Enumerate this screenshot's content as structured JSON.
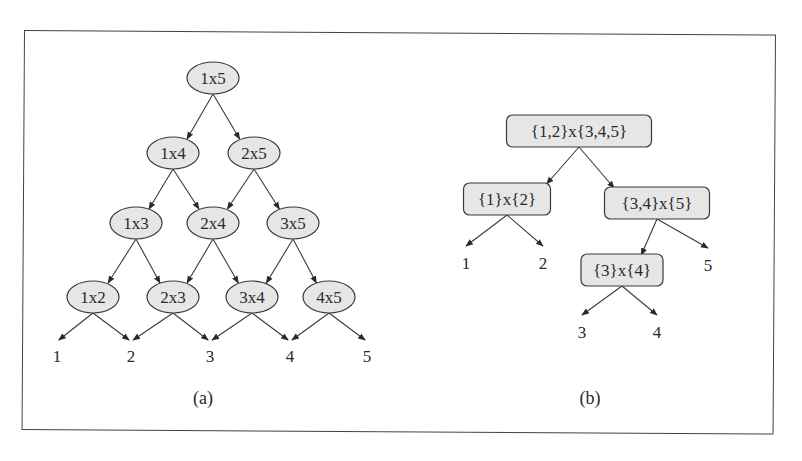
{
  "colors": {
    "node_fill": "#e6e6e6",
    "node_stroke": "#3a3a3a",
    "text": "#2a2a2a",
    "frame": "#444444"
  },
  "panel_a": {
    "caption": "(a)",
    "nodes": [
      {
        "id": "1x5",
        "label": "1x5",
        "x": 213,
        "y": 78
      },
      {
        "id": "1x4",
        "label": "1x4",
        "x": 173,
        "y": 153
      },
      {
        "id": "2x5",
        "label": "2x5",
        "x": 254,
        "y": 153
      },
      {
        "id": "1x3",
        "label": "1x3",
        "x": 136,
        "y": 223
      },
      {
        "id": "2x4",
        "label": "2x4",
        "x": 213,
        "y": 223
      },
      {
        "id": "3x5",
        "label": "3x5",
        "x": 293,
        "y": 223
      },
      {
        "id": "1x2",
        "label": "1x2",
        "x": 93,
        "y": 297
      },
      {
        "id": "2x3",
        "label": "2x3",
        "x": 173,
        "y": 297
      },
      {
        "id": "3x4",
        "label": "3x4",
        "x": 252,
        "y": 297
      },
      {
        "id": "4x5",
        "label": "4x5",
        "x": 329,
        "y": 297
      }
    ],
    "leaves": [
      {
        "id": "1",
        "label": "1",
        "x": 57,
        "y": 356
      },
      {
        "id": "2",
        "label": "2",
        "x": 131,
        "y": 356
      },
      {
        "id": "3",
        "label": "3",
        "x": 210,
        "y": 356
      },
      {
        "id": "4",
        "label": "4",
        "x": 290,
        "y": 356
      },
      {
        "id": "5",
        "label": "5",
        "x": 367,
        "y": 356
      }
    ],
    "edges": [
      [
        "1x5",
        "1x4"
      ],
      [
        "1x5",
        "2x5"
      ],
      [
        "1x4",
        "1x3"
      ],
      [
        "1x4",
        "2x4"
      ],
      [
        "2x5",
        "2x4"
      ],
      [
        "2x5",
        "3x5"
      ],
      [
        "1x3",
        "1x2"
      ],
      [
        "1x3",
        "2x3"
      ],
      [
        "2x4",
        "2x3"
      ],
      [
        "2x4",
        "3x4"
      ],
      [
        "3x5",
        "3x4"
      ],
      [
        "3x5",
        "4x5"
      ],
      [
        "1x2",
        "1"
      ],
      [
        "1x2",
        "2"
      ],
      [
        "2x3",
        "2"
      ],
      [
        "2x3",
        "3"
      ],
      [
        "3x4",
        "3"
      ],
      [
        "3x4",
        "4"
      ],
      [
        "4x5",
        "4"
      ],
      [
        "4x5",
        "5"
      ]
    ]
  },
  "panel_b": {
    "caption": "(b)",
    "nodes": [
      {
        "id": "root",
        "label": "{1,2}x{3,4,5}",
        "x": 579,
        "y": 131,
        "w": 145,
        "h": 32
      },
      {
        "id": "l",
        "label": "{1}x{2}",
        "x": 507,
        "y": 199,
        "w": 87,
        "h": 32
      },
      {
        "id": "r",
        "label": "{3,4}x{5}",
        "x": 657,
        "y": 203,
        "w": 105,
        "h": 32
      },
      {
        "id": "rl",
        "label": "{3}x{4}",
        "x": 622,
        "y": 270,
        "w": 82,
        "h": 32
      }
    ],
    "leaves": [
      {
        "id": "1",
        "label": "1",
        "x": 466,
        "y": 263
      },
      {
        "id": "2",
        "label": "2",
        "x": 543,
        "y": 263
      },
      {
        "id": "5",
        "label": "5",
        "x": 708,
        "y": 265
      },
      {
        "id": "3",
        "label": "3",
        "x": 582,
        "y": 332
      },
      {
        "id": "4",
        "label": "4",
        "x": 657,
        "y": 332
      }
    ],
    "edges": [
      [
        "root",
        "l"
      ],
      [
        "root",
        "r"
      ],
      [
        "l",
        "1"
      ],
      [
        "l",
        "2"
      ],
      [
        "r",
        "rl"
      ],
      [
        "r",
        "5"
      ],
      [
        "rl",
        "3"
      ],
      [
        "rl",
        "4"
      ]
    ]
  }
}
